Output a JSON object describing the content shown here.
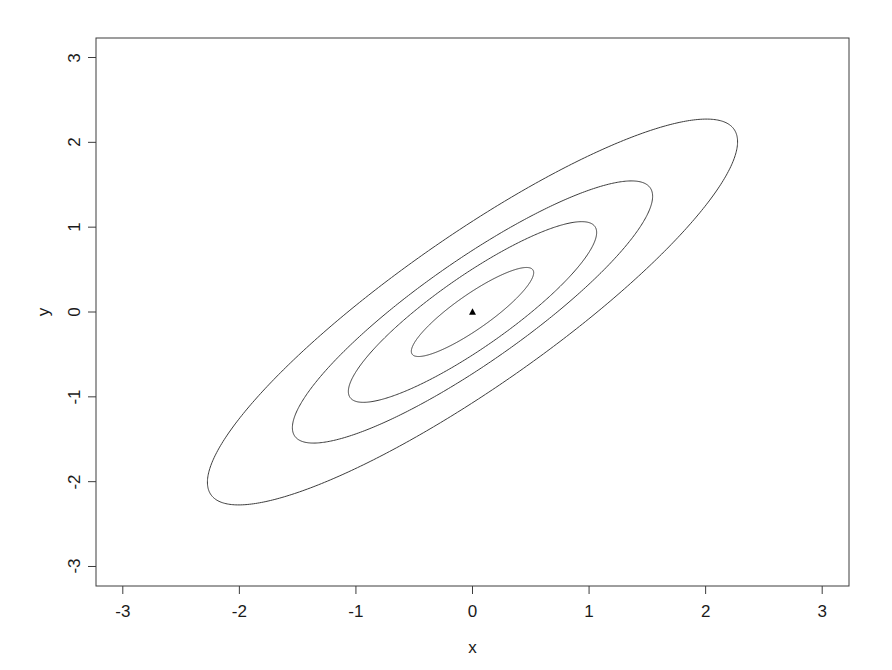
{
  "chart_data": {
    "type": "line",
    "subtype": "contour",
    "title": "",
    "xlabel": "x",
    "ylabel": "y",
    "xlim": [
      -3.23,
      3.23
    ],
    "ylim": [
      -3.23,
      3.23
    ],
    "xticks": [
      -3,
      -2,
      -1,
      0,
      1,
      2,
      3
    ],
    "xtick_labels": [
      "-3",
      "-2",
      "-1",
      "0",
      "1",
      "2",
      "3"
    ],
    "yticks": [
      -3,
      -2,
      -1,
      0,
      1,
      2,
      3
    ],
    "ytick_labels": [
      "-3",
      "-2",
      "-1",
      "0",
      "1",
      "2",
      "3"
    ],
    "grid": false,
    "legend": null,
    "frame": true,
    "line_color": "#3c3c3c",
    "line_width": 1,
    "background": "#ffffff",
    "center_point": {
      "x": 0,
      "y": 0,
      "marker": "filled-triangle",
      "color": "#000000",
      "size": 6
    },
    "contours": [
      {
        "level": 1,
        "name": "innermost-contour",
        "semi_major": 0.72,
        "semi_minor": 0.18,
        "angle_deg": 45,
        "x_extent": [
          -0.51,
          0.51
        ],
        "y_extent": [
          -0.51,
          0.51
        ]
      },
      {
        "level": 2,
        "name": "second-contour",
        "semi_major": 1.46,
        "semi_minor": 0.37,
        "angle_deg": 45,
        "x_extent": [
          -1.03,
          1.03
        ],
        "y_extent": [
          -1.03,
          1.03
        ]
      },
      {
        "level": 3,
        "name": "third-contour",
        "semi_major": 2.12,
        "semi_minor": 0.53,
        "angle_deg": 45,
        "x_extent": [
          -2.0,
          2.0
        ],
        "y_extent": [
          -2.0,
          2.0
        ]
      },
      {
        "level": 4,
        "name": "outermost-contour",
        "semi_major": 3.12,
        "semi_minor": 0.78,
        "angle_deg": 45,
        "x_extent": [
          -3.0,
          3.0
        ],
        "y_extent": [
          -3.0,
          3.0
        ]
      }
    ]
  }
}
